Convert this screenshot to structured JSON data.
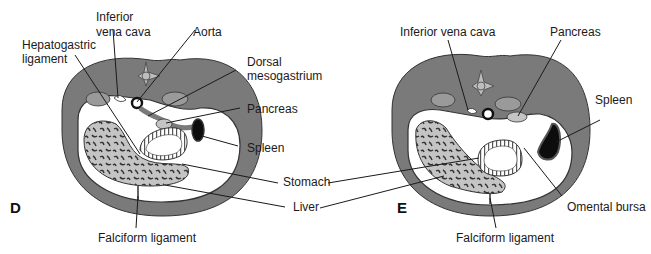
{
  "figure": {
    "panels": [
      {
        "id": "D",
        "letter": "D",
        "labels": {
          "inferior_vena_cava_1": "Inferior",
          "inferior_vena_cava_2": "vena cava",
          "aorta": "Aorta",
          "hepatogastric_1": "Hepatogastric",
          "hepatogastric_2": "ligament",
          "dorsal_meso_1": "Dorsal",
          "dorsal_meso_2": "mesogastrium",
          "pancreas": "Pancreas",
          "spleen": "Spleen",
          "falciform": "Falciform ligament"
        }
      },
      {
        "id": "E",
        "letter": "E",
        "labels": {
          "inferior_vena_cava": "Inferior vena cava",
          "pancreas": "Pancreas",
          "spleen": "Spleen",
          "omental_bursa": "Omental bursa",
          "falciform": "Falciform ligament"
        }
      }
    ],
    "shared_labels": {
      "stomach": "Stomach",
      "liver": "Liver"
    },
    "colors": {
      "body_wall": "#7a7a7a",
      "organ_fill": "#c4c4c4",
      "cavity": "#ffffff",
      "spleen": "#0d0d0d",
      "outline": "#3a3a3a"
    }
  }
}
